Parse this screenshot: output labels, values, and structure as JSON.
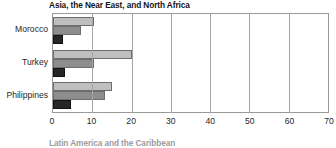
{
  "chart_data": {
    "type": "bar",
    "orientation": "horizontal",
    "title": "Asia, the Near East, and North Africa",
    "xlabel": "",
    "ylabel": "",
    "categories": [
      "Morocco",
      "Turkey",
      "Philippines"
    ],
    "series": [
      {
        "name": "series-1",
        "color": "#bfbfbf",
        "values": [
          10.5,
          20.0,
          15.0
        ]
      },
      {
        "name": "series-2",
        "color": "#8d8d8d",
        "values": [
          7.0,
          10.5,
          13.3
        ]
      },
      {
        "name": "series-3",
        "color": "#262626",
        "values": [
          2.5,
          3.0,
          4.6
        ]
      }
    ],
    "xlim": [
      0,
      70
    ],
    "xticks": [
      0,
      10,
      20,
      30,
      40,
      50,
      60,
      70
    ],
    "xtick_labels": [
      "0",
      "10",
      "20",
      "30",
      "40",
      "50",
      "60",
      "70"
    ],
    "grid": true,
    "grid_axis": "x",
    "legend": "none"
  },
  "next_chart": {
    "title": "Latin America and the Caribbean"
  }
}
